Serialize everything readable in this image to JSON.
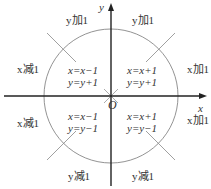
{
  "axes": {
    "x_label": "x",
    "y_label": "y",
    "origin_label": "O"
  },
  "regions": [
    {
      "id": "top-left-outer",
      "text": "y加1"
    },
    {
      "id": "top-right-outer",
      "text": "y加1"
    },
    {
      "id": "left-upper-outer",
      "text": "x减1"
    },
    {
      "id": "right-upper-outer",
      "text": "x加1"
    },
    {
      "id": "left-lower-outer",
      "text": "x减1"
    },
    {
      "id": "right-lower-outer",
      "text": "x加1"
    },
    {
      "id": "bottom-left-outer",
      "text": "y减1"
    },
    {
      "id": "bottom-right-outer",
      "text": "y减1"
    }
  ],
  "quadrants": {
    "q2": {
      "line1": "x=x−1",
      "line2": "y=y+1"
    },
    "q1": {
      "line1": "x=x+1",
      "line2": "y=y+1"
    },
    "q3": {
      "line1": "x=x−1",
      "line2": "y=y−1"
    },
    "q4": {
      "line1": "x=x+1",
      "line2": "y=y−1"
    }
  }
}
